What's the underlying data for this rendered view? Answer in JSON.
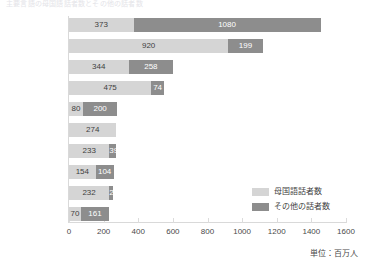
{
  "title_strip": "主要言語の母国語話者数とその他の話者数",
  "chart_data": {
    "type": "bar",
    "orientation": "horizontal",
    "stacked": true,
    "title": "",
    "xlabel": "",
    "ylabel": "",
    "xlim": [
      0,
      1600
    ],
    "xticks": [
      0,
      200,
      400,
      600,
      800,
      1000,
      1200,
      1400,
      1600
    ],
    "xtick_labels": [
      "0",
      "200",
      "400",
      "600",
      "800",
      "1000",
      "1200",
      "1400",
      "1600"
    ],
    "grid": false,
    "legend_position": "right-bottom",
    "unit_note": "単位：百万人",
    "categories": [
      "英語",
      "中国語",
      "ヒンディー語",
      "スペイン語",
      "フランス語",
      "アラビア語",
      "ベンガル語",
      "ロシア語",
      "ポルトガル語",
      "ウルドゥー語"
    ],
    "series": [
      {
        "name": "母国語話者数",
        "color": "#d5d5d5",
        "values": [
          373,
          920,
          344,
          475,
          80,
          274,
          233,
          154,
          232,
          70
        ]
      },
      {
        "name": "その他の話者数",
        "color": "#8d8d8d",
        "values": [
          1080,
          199,
          258,
          74,
          200,
          0,
          39,
          104,
          25,
          161
        ]
      }
    ],
    "totals": [
      1453,
      1119,
      602,
      549,
      280,
      274,
      272,
      258,
      257,
      231
    ]
  },
  "legend": {
    "items": [
      {
        "label": "母国語話者数",
        "color": "#d5d5d5",
        "key": "native"
      },
      {
        "label": "その他の話者数",
        "color": "#8d8d8d",
        "key": "other"
      }
    ]
  }
}
